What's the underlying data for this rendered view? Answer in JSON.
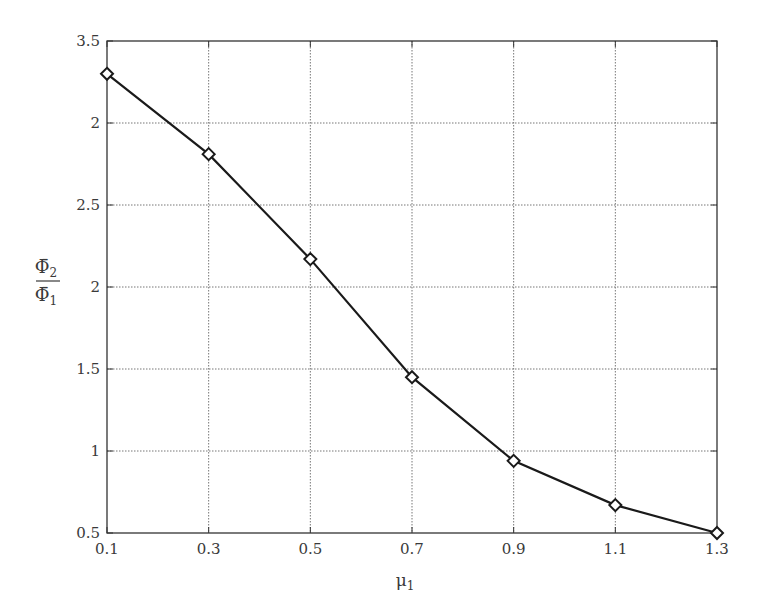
{
  "chart_data": {
    "type": "line",
    "title": "",
    "xlabel": "μ1",
    "xlabel_main": "μ",
    "xlabel_sub": "1",
    "ylabel": "Φ̄2 / Φ̄1",
    "ylabel_num_main": "Φ̄",
    "ylabel_num_sub": "2",
    "ylabel_den_main": "Φ̄",
    "ylabel_den_sub": "1",
    "x": [
      0.1,
      0.3,
      0.5,
      0.7,
      0.9,
      1.1,
      1.3
    ],
    "series": [
      {
        "name": "Φ̄2/Φ̄1",
        "marker": "diamond",
        "color": "#1a1a1a",
        "values": [
          3.3,
          2.81,
          2.17,
          1.45,
          0.94,
          0.67,
          0.5
        ]
      }
    ],
    "xlim": [
      0.1,
      1.3
    ],
    "ylim": [
      0.5,
      3.5
    ],
    "xticks": [
      0.1,
      0.3,
      0.5,
      0.7,
      0.9,
      1.1,
      1.3
    ],
    "xtick_labels": [
      "0.1",
      "0.3",
      "0.5",
      "0.7",
      "0.9",
      "1.1",
      "1.3"
    ],
    "yticks": [
      0.5,
      1.0,
      1.5,
      2.0,
      2.5,
      3.0,
      3.5
    ],
    "ytick_labels": [
      "0.5",
      "1",
      "1.5",
      "2",
      "2.5",
      "2",
      "3.5"
    ],
    "grid": true,
    "legend": null
  },
  "style": {
    "axis_color": "#333333",
    "grid_color": "#777777",
    "line_color": "#1a1a1a"
  }
}
